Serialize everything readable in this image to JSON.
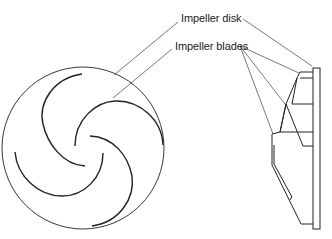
{
  "diagram": {
    "type": "technical-illustration",
    "subject": "impeller",
    "views": [
      "front-view",
      "side-view"
    ],
    "labels": {
      "impeller_disk": "Impeller disk",
      "impeller_blades": "Impeller blades"
    },
    "front_view": {
      "disk_outline": "circle",
      "blade_count": 4,
      "blade_shape": "curved"
    },
    "colors": {
      "line": "#222222",
      "leader": "#555555",
      "background": "#ffffff"
    }
  }
}
